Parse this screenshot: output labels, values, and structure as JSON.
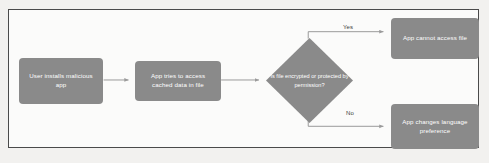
{
  "diagram": {
    "type": "flowchart",
    "orientation": "left-to-right",
    "colors": {
      "node_fill": "#8a8a8a",
      "node_text": "#ffffff",
      "edge_stroke": "#9a9a9a",
      "canvas": "#fbfbfa",
      "frame_border": "#4a4a4a",
      "page_background": "#f2f1ef"
    },
    "nodes": [
      {
        "id": "install",
        "shape": "rounded-rect",
        "label": "User installs malicious app"
      },
      {
        "id": "access-data",
        "shape": "rounded-rect",
        "label": "App tries to access cached data in file"
      },
      {
        "id": "decision",
        "shape": "diamond",
        "label": "Is file encrypted or protected by permission?"
      },
      {
        "id": "cannot-access",
        "shape": "rounded-rect",
        "label": "App cannot access file"
      },
      {
        "id": "change-lang",
        "shape": "rounded-rect",
        "label": "App changes language preference"
      }
    ],
    "edges": [
      {
        "id": "e1",
        "from": "install",
        "to": "access-data",
        "label": ""
      },
      {
        "id": "e2",
        "from": "access-data",
        "to": "decision",
        "label": ""
      },
      {
        "id": "e3",
        "from": "decision",
        "to": "cannot-access",
        "label": "Yes"
      },
      {
        "id": "e4",
        "from": "decision",
        "to": "change-lang",
        "label": "No"
      }
    ],
    "edge_labels": {
      "yes": "Yes",
      "no": "No"
    }
  }
}
